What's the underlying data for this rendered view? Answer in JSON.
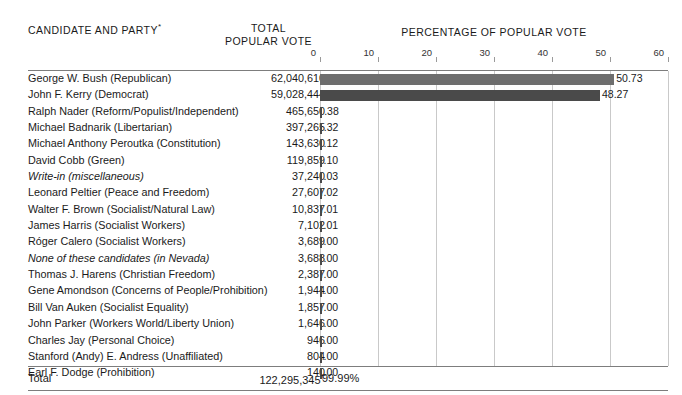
{
  "header": {
    "candidate_col": "CANDIDATE AND PARTY",
    "candidate_col_mark": "*",
    "total_col_line1": "TOTAL",
    "total_col_line2": "POPULAR VOTE",
    "chart_title": "PERCENTAGE OF POPULAR VOTE"
  },
  "total_row": {
    "label": "Total",
    "votes": "122,295,345",
    "votes_mark": "†",
    "percent": "99.99%"
  },
  "chart_data": {
    "type": "bar",
    "title": "PERCENTAGE OF POPULAR VOTE",
    "xlabel": "",
    "ylabel": "",
    "xlim": [
      0,
      60
    ],
    "xticks": [
      0,
      10,
      20,
      30,
      40,
      50,
      60
    ],
    "xtick_labels": [
      "0",
      "10",
      "20",
      "30",
      "40",
      "50",
      "60"
    ],
    "grid": true,
    "orientation": "horizontal",
    "legend": "none",
    "colors": {
      "bar_light": "#6e6e6e",
      "bar_dark": "#4a4a4a",
      "gridline": "#c9c9c9",
      "rule": "#7d7d7d"
    },
    "categories": [
      "George W. Bush (Republican)",
      "John F. Kerry (Democrat)",
      "Ralph Nader (Reform/Populist/Independent)",
      "Michael Badnarik (Libertarian)",
      "Michael Anthony Peroutka (Constitution)",
      "David Cobb (Green)",
      "Write-in (miscellaneous)",
      "Leonard Peltier (Peace and Freedom)",
      "Walter F. Brown (Socialist/Natural Law)",
      "James Harris (Socialist Workers)",
      "Róger Calero (Socialist Workers)",
      "None of these candidates (in Nevada)",
      "Thomas J. Harens (Christian Freedom)",
      "Gene Amondson (Concerns of People/Prohibition)",
      "Bill Van Auken (Socialist Equality)",
      "John Parker (Workers World/Liberty Union)",
      "Charles Jay (Personal Choice)",
      "Stanford (Andy) E. Andress (Unaffiliated)",
      "Earl F. Dodge (Prohibition)"
    ],
    "values": [
      50.73,
      48.27,
      0.38,
      0.32,
      0.12,
      0.1,
      0.03,
      0.02,
      0.01,
      0.01,
      0.0,
      0.0,
      0.0,
      0.0,
      0.0,
      0.0,
      0.0,
      0.0,
      0.0
    ],
    "value_labels": [
      "50.73",
      "48.27",
      ".38",
      ".32",
      ".12",
      ".10",
      ".03",
      ".02",
      ".01",
      ".01",
      ".00",
      ".00",
      ".00",
      ".00",
      ".00",
      ".00",
      ".00",
      ".00",
      ".00"
    ],
    "votes": [
      62040610,
      59028444,
      465650,
      397265,
      143630,
      119859,
      37240,
      27607,
      10837,
      7102,
      3689,
      3688,
      2387,
      1944,
      1857,
      1646,
      946,
      804,
      140
    ],
    "vote_labels": [
      "62,040,610",
      "59,028,444",
      "465,650",
      "397,265",
      "143,630",
      "119,859",
      "37,240",
      "27,607",
      "10,837",
      "7,102",
      "3,689",
      "3,688",
      "2,387",
      "1,944",
      "1,857",
      "1,646",
      "946",
      "804",
      "140"
    ],
    "total_votes": 122295345,
    "total_percent": "99.99%"
  },
  "rows": [
    {
      "name": "George W. Bush (Republican)",
      "italic": false,
      "votes": "62,040,610",
      "pct": "50.73",
      "value": 50.73,
      "color": "#6e6e6e"
    },
    {
      "name": "John F. Kerry (Democrat)",
      "italic": false,
      "votes": "59,028,444",
      "pct": "48.27",
      "value": 48.27,
      "color": "#4a4a4a"
    },
    {
      "name": "Ralph Nader (Reform/Populist/Independent)",
      "italic": false,
      "votes": "465,650",
      "pct": ".38",
      "value": 0.38,
      "color": "#4a4a4a"
    },
    {
      "name": "Michael Badnarik (Libertarian)",
      "italic": false,
      "votes": "397,265",
      "pct": ".32",
      "value": 0.32,
      "color": "#4a4a4a"
    },
    {
      "name": "Michael Anthony Peroutka (Constitution)",
      "italic": false,
      "votes": "143,630",
      "pct": ".12",
      "value": 0.12,
      "color": "#4a4a4a"
    },
    {
      "name": "David Cobb (Green)",
      "italic": false,
      "votes": "119,859",
      "pct": ".10",
      "value": 0.1,
      "color": "#4a4a4a"
    },
    {
      "name": "Write-in (miscellaneous)",
      "italic": true,
      "votes": "37,240",
      "pct": ".03",
      "value": 0.03,
      "color": "#4a4a4a"
    },
    {
      "name": "Leonard Peltier (Peace and Freedom)",
      "italic": false,
      "votes": "27,607",
      "pct": ".02",
      "value": 0.02,
      "color": "#4a4a4a"
    },
    {
      "name": "Walter F. Brown (Socialist/Natural Law)",
      "italic": false,
      "votes": "10,837",
      "pct": ".01",
      "value": 0.01,
      "color": "#4a4a4a"
    },
    {
      "name": "James Harris (Socialist Workers)",
      "italic": false,
      "votes": "7,102",
      "pct": ".01",
      "value": 0.01,
      "color": "#4a4a4a"
    },
    {
      "name": "Róger Calero (Socialist Workers)",
      "italic": false,
      "votes": "3,689",
      "pct": ".00",
      "value": 0.0,
      "color": "#4a4a4a"
    },
    {
      "name": "None of these candidates (in Nevada)",
      "italic": true,
      "votes": "3,688",
      "pct": ".00",
      "value": 0.0,
      "color": "#4a4a4a"
    },
    {
      "name": "Thomas J. Harens (Christian Freedom)",
      "italic": false,
      "votes": "2,387",
      "pct": ".00",
      "value": 0.0,
      "color": "#4a4a4a"
    },
    {
      "name": "Gene Amondson (Concerns of People/Prohibition)",
      "italic": false,
      "votes": "1,944",
      "pct": ".00",
      "value": 0.0,
      "color": "#4a4a4a"
    },
    {
      "name": "Bill Van Auken (Socialist Equality)",
      "italic": false,
      "votes": "1,857",
      "pct": ".00",
      "value": 0.0,
      "color": "#4a4a4a"
    },
    {
      "name": "John Parker (Workers World/Liberty Union)",
      "italic": false,
      "votes": "1,646",
      "pct": ".00",
      "value": 0.0,
      "color": "#4a4a4a"
    },
    {
      "name": "Charles Jay (Personal Choice)",
      "italic": false,
      "votes": "946",
      "pct": ".00",
      "value": 0.0,
      "color": "#4a4a4a"
    },
    {
      "name": "Stanford (Andy) E. Andress (Unaffiliated)",
      "italic": false,
      "votes": "804",
      "pct": ".00",
      "value": 0.0,
      "color": "#4a4a4a"
    },
    {
      "name": "Earl F. Dodge (Prohibition)",
      "italic": false,
      "votes": "140",
      "pct": ".00",
      "value": 0.0,
      "color": "#4a4a4a"
    }
  ]
}
